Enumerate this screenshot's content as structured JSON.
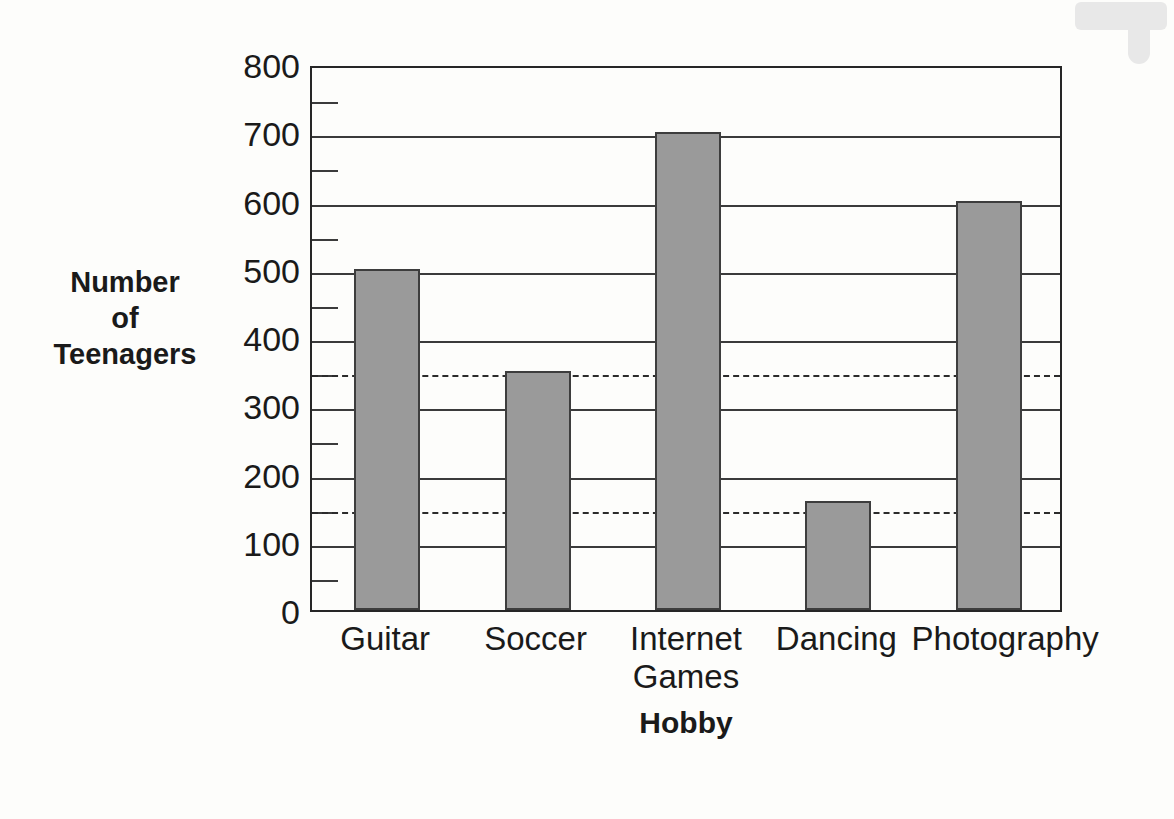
{
  "chart_data": {
    "type": "bar",
    "title": "",
    "categories": [
      "Guitar",
      "Soccer",
      "Internet Games",
      "Dancing",
      "Photography"
    ],
    "category_lines": [
      [
        "Guitar"
      ],
      [
        "Soccer"
      ],
      [
        "Internet",
        "Games"
      ],
      [
        "Dancing"
      ],
      [
        "Photography"
      ]
    ],
    "values": [
      500,
      350,
      700,
      160,
      600
    ],
    "xlabel": "Hobby",
    "ylabel": "Number of Teenagers",
    "ylabel_lines": [
      "Number",
      "of",
      "Teenagers"
    ],
    "ylim": [
      0,
      800
    ],
    "ytick_values": [
      0,
      100,
      200,
      300,
      400,
      500,
      600,
      700,
      800
    ],
    "ytick_labels": [
      "0",
      "100",
      "200",
      "300",
      "400",
      "500",
      "600",
      "700",
      "800"
    ],
    "minor_tick_values": [
      50,
      150,
      250,
      350,
      450,
      550,
      650,
      750
    ],
    "gridlines": [
      100,
      200,
      300,
      400,
      500,
      600,
      700
    ],
    "grid": true,
    "legend": "none",
    "reference_lines": [
      {
        "value": 350,
        "style": "dashed"
      },
      {
        "value": 150,
        "style": "dashed"
      }
    ],
    "bar_color": "#9a9a9a",
    "bar_border_color": "#3d3d3d",
    "axis_color": "#262626",
    "background_color": "#fdfdfb"
  },
  "artifacts": {
    "ghost_text_1": "Tl 1 I  below  is  the number  of  college",
    "ghost_text_2": "teenagers"
  }
}
